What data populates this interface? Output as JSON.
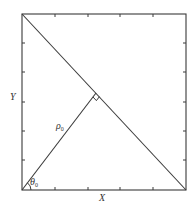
{
  "diagram": {
    "type": "geometry",
    "colors": {
      "stroke": "#3a3a3a",
      "background": "#ffffff",
      "text": "#333333"
    },
    "labels": {
      "x_axis": "X",
      "y_axis": "Y",
      "rho": "ρ",
      "rho_sub": "0",
      "theta": "θ",
      "theta_sub": "0"
    },
    "box": {
      "x1": 22,
      "y1": 14,
      "x2": 186,
      "y2": 190
    },
    "diagonal_line": {
      "from": [
        22,
        14
      ],
      "to": [
        186,
        190
      ]
    },
    "perpendicular": {
      "from": [
        22,
        190
      ],
      "to": [
        96,
        93
      ],
      "label": "ρ0"
    },
    "right_angle_marker": {
      "at": [
        96,
        93
      ]
    },
    "angle_arc": {
      "at": [
        22,
        190
      ],
      "label": "θ0"
    },
    "ticks": {
      "top_x": [
        55,
        88,
        120,
        153
      ],
      "bottom_x": [
        55,
        88,
        120,
        153
      ],
      "left_y": [
        43,
        72,
        102,
        131,
        160
      ],
      "right_y": [
        43,
        72,
        102,
        131,
        160
      ]
    }
  }
}
